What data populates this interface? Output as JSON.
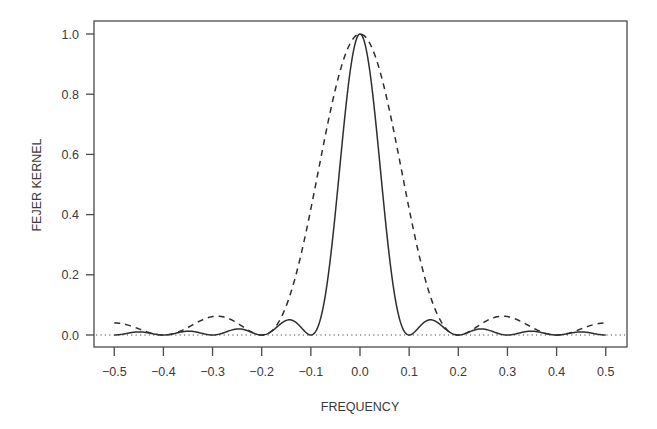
{
  "chart_data": {
    "type": "line",
    "title": "",
    "xlabel": "FREQUENCY",
    "ylabel": "FEJER KERNEL",
    "xlim": [
      -0.5,
      0.5
    ],
    "ylim": [
      0.0,
      1.0
    ],
    "grid": false,
    "legend": null,
    "x_ticks": [
      -0.5,
      -0.4,
      -0.3,
      -0.2,
      -0.1,
      0.0,
      0.1,
      0.2,
      0.3,
      0.4,
      0.5
    ],
    "x_tick_labels": [
      "-0.5",
      "-0.4",
      "-0.3",
      "-0.2",
      "-0.1",
      "0.0",
      "0.1",
      "0.2",
      "0.3",
      "0.4",
      "0.5"
    ],
    "y_ticks": [
      0.0,
      0.2,
      0.4,
      0.6,
      0.8,
      1.0
    ],
    "y_tick_labels": [
      "0.0",
      "0.2",
      "0.4",
      "0.6",
      "0.8",
      "1.0"
    ],
    "reference_line": {
      "y": 0.0,
      "style": "dotted"
    },
    "series": [
      {
        "name": "Fejer kernel N=10",
        "style": "solid",
        "x": [
          -0.5,
          -0.45,
          -0.4,
          -0.35,
          -0.3,
          -0.25,
          -0.2,
          -0.15,
          -0.1,
          -0.075,
          -0.05,
          -0.025,
          0.0,
          0.025,
          0.05,
          0.075,
          0.1,
          0.15,
          0.2,
          0.25,
          0.3,
          0.35,
          0.4,
          0.45,
          0.5
        ],
        "y": [
          0.0,
          0.0105,
          0.0,
          0.0124,
          0.0,
          0.02,
          0.0,
          0.0472,
          0.0,
          0.1054,
          0.4053,
          0.8106,
          1.0,
          0.8106,
          0.4053,
          0.1054,
          0.0,
          0.0472,
          0.0,
          0.02,
          0.0,
          0.0124,
          0.0,
          0.0105,
          0.0
        ]
      },
      {
        "name": "Fejer kernel N=5",
        "style": "dashed",
        "x": [
          -0.5,
          -0.45,
          -0.4,
          -0.35,
          -0.3,
          -0.25,
          -0.2,
          -0.15,
          -0.1,
          -0.05,
          0.0,
          0.05,
          0.1,
          0.15,
          0.2,
          0.25,
          0.3,
          0.35,
          0.4,
          0.45,
          0.5
        ],
        "y": [
          0.04,
          0.0246,
          0.0,
          0.0244,
          0.0611,
          0.04,
          0.0,
          0.2118,
          0.5235,
          0.8533,
          1.0,
          0.8533,
          0.5235,
          0.2118,
          0.0,
          0.04,
          0.0611,
          0.0244,
          0.0,
          0.0246,
          0.04
        ]
      }
    ]
  },
  "colors": {
    "axis": "#4a4a4a",
    "line": "#2e2e2e",
    "background": "#ffffff"
  }
}
